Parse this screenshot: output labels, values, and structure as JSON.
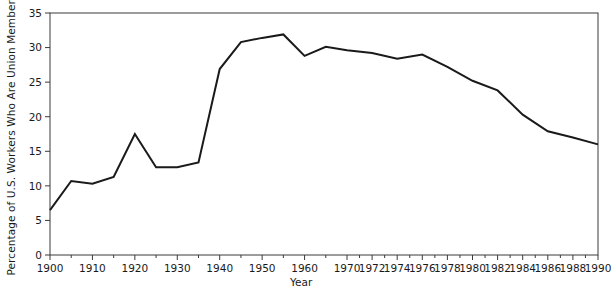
{
  "chart_data": {
    "type": "line",
    "title": "",
    "xlabel": "Year",
    "ylabel": "Percentage of U.S. Workers Who Are Union Members",
    "ylim": [
      0,
      35
    ],
    "ytick_values": [
      0,
      5,
      10,
      15,
      20,
      25,
      30,
      35
    ],
    "ytick_labels": [
      "0",
      "5",
      "10",
      "15",
      "20",
      "25",
      "30",
      "35"
    ],
    "xtick_labels": [
      "1900",
      "1910",
      "1920",
      "1930",
      "1940",
      "1950",
      "1960",
      "1970",
      "1972",
      "1974",
      "1976",
      "1978",
      "1980",
      "1982",
      "1984",
      "1986",
      "1988",
      "1990"
    ],
    "xtick_values": [
      1900,
      1910,
      1920,
      1930,
      1940,
      1950,
      1960,
      1970,
      1972,
      1974,
      1976,
      1978,
      1980,
      1982,
      1984,
      1986,
      1988,
      1990
    ],
    "x_minor_values": [
      1905,
      1915,
      1925,
      1935,
      1945,
      1955,
      1965,
      1971,
      1973,
      1975,
      1977,
      1979,
      1981,
      1983,
      1985,
      1987,
      1989
    ],
    "x_axis_note": "piecewise scale: decade spacing 1900-1970, two-year spacing 1970-1990",
    "grid": false,
    "legend": null,
    "line_color": "#1a1a1a",
    "series": [
      {
        "name": "Percentage of U.S. Workers Who Are Union Members",
        "points": [
          [
            1900,
            6.5
          ],
          [
            1905,
            10.7
          ],
          [
            1910,
            10.3
          ],
          [
            1915,
            11.3
          ],
          [
            1920,
            17.5
          ],
          [
            1925,
            12.7
          ],
          [
            1930,
            12.7
          ],
          [
            1935,
            13.4
          ],
          [
            1940,
            26.9
          ],
          [
            1945,
            30.8
          ],
          [
            1950,
            31.4
          ],
          [
            1955,
            31.9
          ],
          [
            1960,
            28.8
          ],
          [
            1965,
            30.1
          ],
          [
            1970,
            29.6
          ],
          [
            1972,
            29.2
          ],
          [
            1974,
            28.4
          ],
          [
            1976,
            29.0
          ],
          [
            1978,
            27.2
          ],
          [
            1980,
            25.2
          ],
          [
            1982,
            23.8
          ],
          [
            1984,
            20.3
          ],
          [
            1986,
            17.9
          ],
          [
            1988,
            17.0
          ],
          [
            1990,
            16.0
          ]
        ]
      }
    ]
  },
  "axes": {
    "frame_color": "#3a3a3a"
  }
}
